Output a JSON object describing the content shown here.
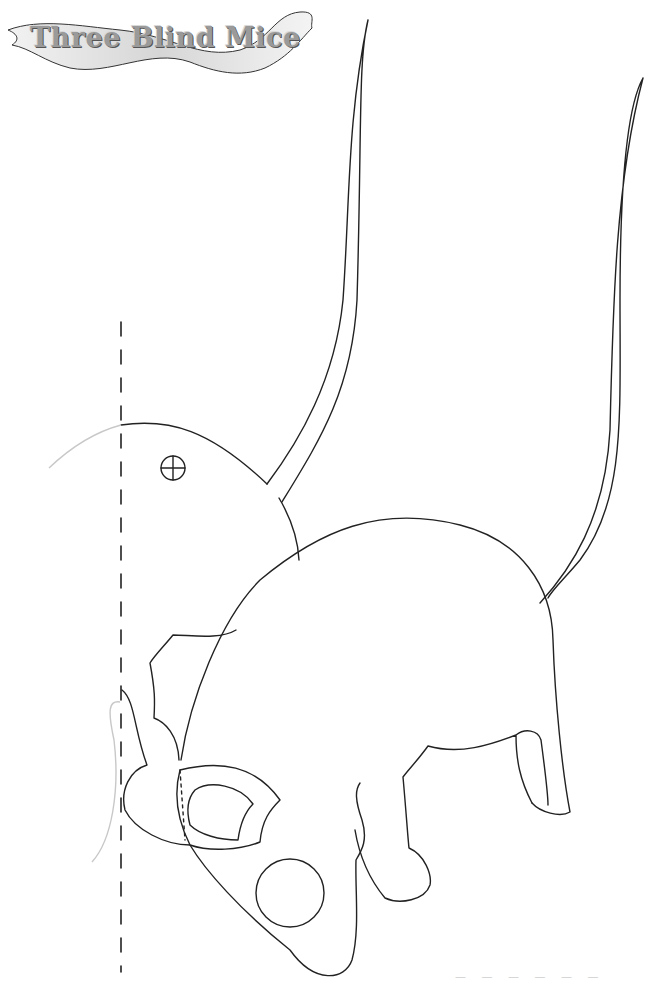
{
  "page": {
    "title": "Three Blind Mice",
    "footer_text": "— — — — — —"
  },
  "template": {
    "parts": [
      "tail-long",
      "tail-short",
      "body",
      "head",
      "ear",
      "nose",
      "front-leg",
      "hind-leg",
      "eye-hole"
    ],
    "fold_line": "dashed-vertical",
    "line_color": "#222222",
    "guide_color": "#c8c8c8"
  }
}
